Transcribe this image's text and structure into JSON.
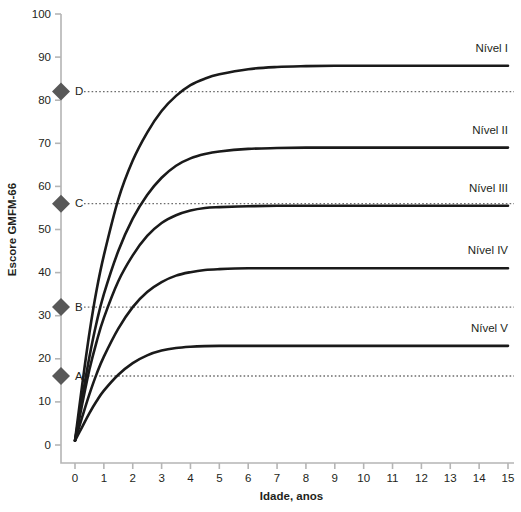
{
  "chart_data": {
    "type": "line",
    "title": "",
    "xlabel": "Idade, anos",
    "ylabel": "Escore GMFM-66",
    "xlim": [
      0,
      15
    ],
    "ylim": [
      0,
      100
    ],
    "xticks": [
      "0",
      "1",
      "2",
      "3",
      "4",
      "5",
      "6",
      "7",
      "8",
      "9",
      "10",
      "11",
      "12",
      "13",
      "14",
      "15"
    ],
    "yticks": [
      "0",
      "10",
      "20",
      "30",
      "40",
      "50",
      "60",
      "70",
      "80",
      "90",
      "100"
    ],
    "grid": false,
    "legend_position": "right-inline",
    "x": [
      0,
      0.25,
      0.5,
      0.75,
      1,
      1.5,
      2,
      2.5,
      3,
      3.5,
      4,
      4.5,
      5,
      6,
      7,
      8,
      9,
      10,
      11,
      12,
      13,
      14,
      15
    ],
    "series": [
      {
        "name": "Nível I",
        "label": "Nível I",
        "plateau": 88,
        "values": [
          1,
          14,
          26,
          36,
          44,
          57,
          66,
          72.5,
          77.5,
          81,
          83.5,
          85,
          86,
          87.2,
          87.7,
          87.9,
          88,
          88,
          88,
          88,
          88,
          88,
          88
        ]
      },
      {
        "name": "Nível II",
        "label": "Nível II",
        "plateau": 69,
        "values": [
          1,
          11,
          20.5,
          28.5,
          35,
          45,
          52.5,
          58,
          62,
          64.8,
          66.5,
          67.5,
          68.1,
          68.7,
          68.9,
          69,
          69,
          69,
          69,
          69,
          69,
          69,
          69
        ]
      },
      {
        "name": "Nível III",
        "label": "Nível III",
        "plateau": 55.5,
        "values": [
          1,
          9.5,
          17.5,
          24,
          29.5,
          38,
          44,
          48.5,
          51.5,
          53.3,
          54.4,
          55,
          55.2,
          55.4,
          55.5,
          55.5,
          55.5,
          55.5,
          55.5,
          55.5,
          55.5,
          55.5,
          55.5
        ]
      },
      {
        "name": "Nível IV",
        "label": "Nível IV",
        "plateau": 41,
        "values": [
          1,
          6.5,
          11.8,
          16.5,
          20.5,
          27,
          32,
          35.5,
          37.8,
          39.3,
          40.1,
          40.6,
          40.8,
          41,
          41,
          41,
          41,
          41,
          41,
          41,
          41,
          41,
          41
        ]
      },
      {
        "name": "Nível V",
        "label": "Nível V",
        "plateau": 23,
        "values": [
          1,
          4.2,
          7.4,
          10.2,
          12.6,
          16.3,
          19,
          20.8,
          21.9,
          22.5,
          22.8,
          22.95,
          23,
          23,
          23,
          23,
          23,
          23,
          23,
          23,
          23,
          23,
          23
        ]
      }
    ],
    "reference_markers": [
      {
        "label": "D",
        "value": 82
      },
      {
        "label": "C",
        "value": 56
      },
      {
        "label": "B",
        "value": 32
      },
      {
        "label": "A",
        "value": 16
      }
    ],
    "colors": {
      "curve": "#1a1a1a",
      "axis": "#b5b5b5",
      "marker": "#585858",
      "reference_line": "#6d6d6d",
      "text": "#231f20",
      "background": "#ffffff"
    }
  }
}
